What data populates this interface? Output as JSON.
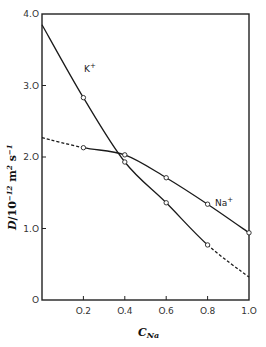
{
  "chart_data": {
    "type": "line",
    "title": "",
    "xlabel": "C_Na",
    "xlabel_main": "C",
    "xlabel_sub": "Na",
    "ylabel": "D/10^-12 m^2 s^-1",
    "xlim": [
      0,
      1.0
    ],
    "ylim": [
      0,
      4.0
    ],
    "grid": false,
    "legend": "inline labels",
    "x_ticks": [
      "0.2",
      "0.4",
      "0.6",
      "0.8",
      "1.0"
    ],
    "y_ticks": [
      "0",
      "1.0",
      "2.0",
      "3.0",
      "4.0"
    ],
    "series": [
      {
        "name": "K+",
        "label": "K",
        "label_sup": "+",
        "x": [
          0.0,
          0.2,
          0.4,
          0.6,
          0.8,
          1.0
        ],
        "values": [
          3.85,
          2.83,
          1.93,
          1.36,
          0.77,
          0.32
        ],
        "marker_x": [
          0.2,
          0.4,
          0.6,
          0.8
        ],
        "solid_range": [
          0.0,
          0.8
        ],
        "dashed_range": [
          0.8,
          1.0
        ]
      },
      {
        "name": "Na+",
        "label": "Na",
        "label_sup": "+",
        "x": [
          0.0,
          0.2,
          0.4,
          0.6,
          0.8,
          1.0
        ],
        "values": [
          2.27,
          2.13,
          2.03,
          1.71,
          1.34,
          0.94
        ],
        "marker_x": [
          0.2,
          0.4,
          0.6,
          0.8,
          1.0
        ],
        "solid_range": [
          0.2,
          1.0
        ],
        "dashed_range": [
          0.0,
          0.2
        ]
      }
    ]
  }
}
